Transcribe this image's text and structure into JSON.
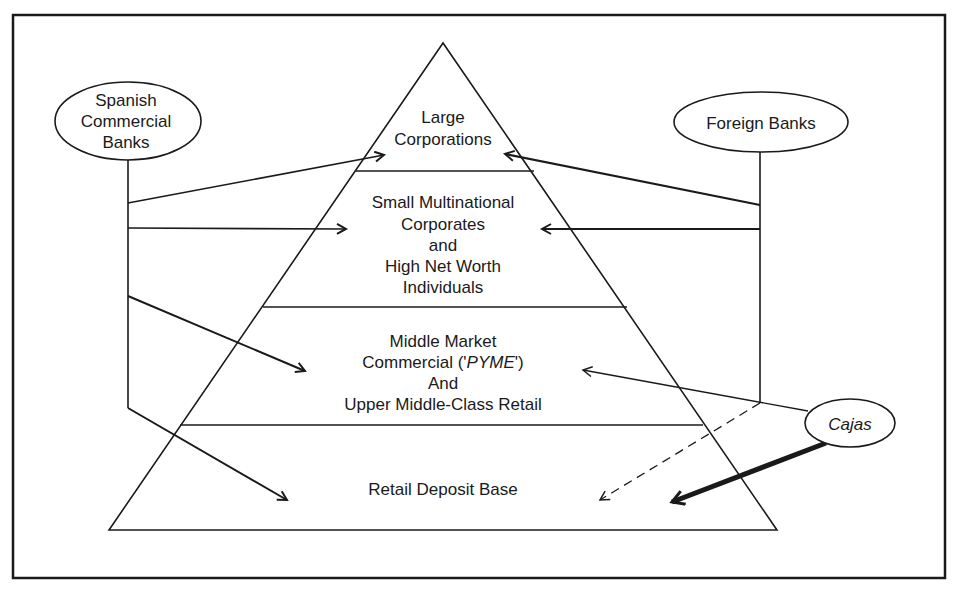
{
  "diagram": {
    "type": "pyramid-market-segmentation",
    "colors": {
      "ink": "#1a1a1a",
      "background": "#ffffff"
    },
    "pyramid": {
      "tiers": [
        {
          "id": "large-corporations",
          "lines": [
            "Large",
            "Corporations"
          ]
        },
        {
          "id": "small-multinational",
          "lines": [
            "Small Multinational",
            "Corporates",
            "and",
            "High Net Worth",
            "Individuals"
          ]
        },
        {
          "id": "middle-market",
          "lines": [
            "Middle Market",
            "Commercial ('PYME')",
            "And",
            "Upper Middle-Class Retail"
          ],
          "italic_term": "PYME"
        },
        {
          "id": "retail-deposit",
          "lines": [
            "Retail Deposit Base"
          ]
        }
      ]
    },
    "actors": {
      "spanish": {
        "lines": [
          "Spanish",
          "Commercial",
          "Banks"
        ]
      },
      "foreign": {
        "label": "Foreign Banks"
      },
      "cajas": {
        "label": "Cajas",
        "italic": true
      }
    },
    "edges": [
      {
        "from": "Spanish Commercial Banks",
        "to": "Large Corporations",
        "style": "solid"
      },
      {
        "from": "Spanish Commercial Banks",
        "to": "Small Multinational Corporates and High Net Worth Individuals",
        "style": "solid"
      },
      {
        "from": "Spanish Commercial Banks",
        "to": "Middle Market Commercial ('PYME') And Upper Middle-Class Retail",
        "style": "solid"
      },
      {
        "from": "Spanish Commercial Banks",
        "to": "Retail Deposit Base",
        "style": "solid"
      },
      {
        "from": "Foreign Banks",
        "to": "Large Corporations",
        "style": "solid"
      },
      {
        "from": "Foreign Banks",
        "to": "Small Multinational Corporates and High Net Worth Individuals",
        "style": "solid"
      },
      {
        "from": "Foreign Banks",
        "to": "Retail Deposit Base",
        "style": "dashed"
      },
      {
        "from": "Cajas",
        "to": "Middle Market Commercial ('PYME') And Upper Middle-Class Retail",
        "style": "thin"
      },
      {
        "from": "Cajas",
        "to": "Retail Deposit Base",
        "style": "heavy"
      }
    ]
  }
}
